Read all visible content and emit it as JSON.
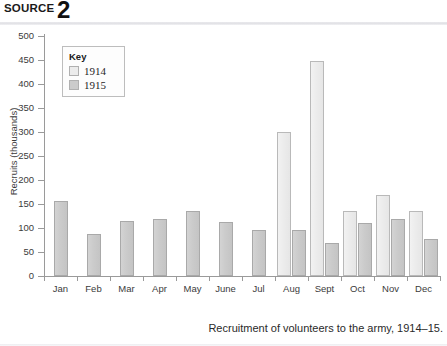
{
  "header": {
    "source_label": "SOURCE",
    "source_number": "2"
  },
  "caption": "Recruitment of volunteers to the army, 1914–15.",
  "legend": {
    "title": "Key",
    "entries": [
      {
        "label": "1914",
        "color": "#ececec"
      },
      {
        "label": "1915",
        "color": "#cbcbcb"
      }
    ]
  },
  "chart_data": {
    "type": "bar",
    "title": "",
    "xlabel": "",
    "ylabel": "Recruits (thousands)",
    "ylim": [
      0,
      500
    ],
    "ytick_step": 50,
    "yticks": [
      0,
      50,
      100,
      150,
      200,
      250,
      300,
      350,
      400,
      450,
      500
    ],
    "ytick_labels": [
      "0",
      "50",
      "100",
      "150",
      "200",
      "250",
      "300",
      "350",
      "400",
      "450",
      "500"
    ],
    "grid": false,
    "legend_position": "top-left-inside",
    "categories": [
      "Jan",
      "Feb",
      "Mar",
      "Apr",
      "May",
      "June",
      "Jul",
      "Aug",
      "Sept",
      "Oct",
      "Nov",
      "Dec"
    ],
    "series": [
      {
        "name": "1914",
        "color": "#ececec",
        "values": [
          null,
          null,
          null,
          null,
          null,
          null,
          null,
          300,
          447,
          135,
          168,
          136
        ]
      },
      {
        "name": "1915",
        "color": "#cbcbcb",
        "values": [
          157,
          88,
          114,
          118,
          135,
          113,
          95,
          96,
          69,
          110,
          119,
          78
        ]
      }
    ]
  }
}
